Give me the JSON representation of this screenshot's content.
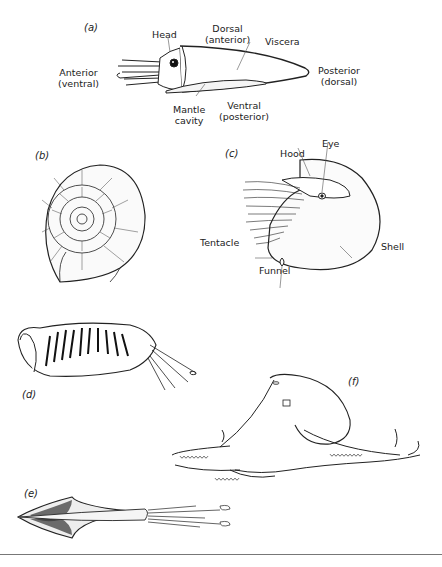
{
  "figure": {
    "panels": [
      {
        "id": "a",
        "label": "(a)",
        "subject": "squid body-plan schematic",
        "annotations": [
          {
            "key": "head",
            "text": "Head"
          },
          {
            "key": "dorsal_anterior",
            "line1": "Dorsal",
            "line2": "(anterior)"
          },
          {
            "key": "viscera",
            "text": "Viscera"
          },
          {
            "key": "anterior_ventral",
            "line1": "Anterior",
            "line2": "(ventral)"
          },
          {
            "key": "posterior_dorsal",
            "line1": "Posterior",
            "line2": "(dorsal)"
          },
          {
            "key": "mantle_cavity",
            "line1": "Mantle",
            "line2": "cavity"
          },
          {
            "key": "ventral_posterior",
            "line1": "Ventral",
            "line2": "(posterior)"
          }
        ]
      },
      {
        "id": "b",
        "label": "(b)",
        "subject": "ammonite shell"
      },
      {
        "id": "c",
        "label": "(c)",
        "subject": "nautilus",
        "annotations": [
          {
            "key": "hood",
            "text": "Hood"
          },
          {
            "key": "eye",
            "text": "Eye"
          },
          {
            "key": "tentacle",
            "text": "Tentacle"
          },
          {
            "key": "funnel",
            "text": "Funnel"
          },
          {
            "key": "shell",
            "text": "Shell"
          }
        ]
      },
      {
        "id": "d",
        "label": "(d)",
        "subject": "cuttlefish"
      },
      {
        "id": "e",
        "label": "(e)",
        "subject": "squid"
      },
      {
        "id": "f",
        "label": "(f)",
        "subject": "octopus"
      }
    ]
  }
}
